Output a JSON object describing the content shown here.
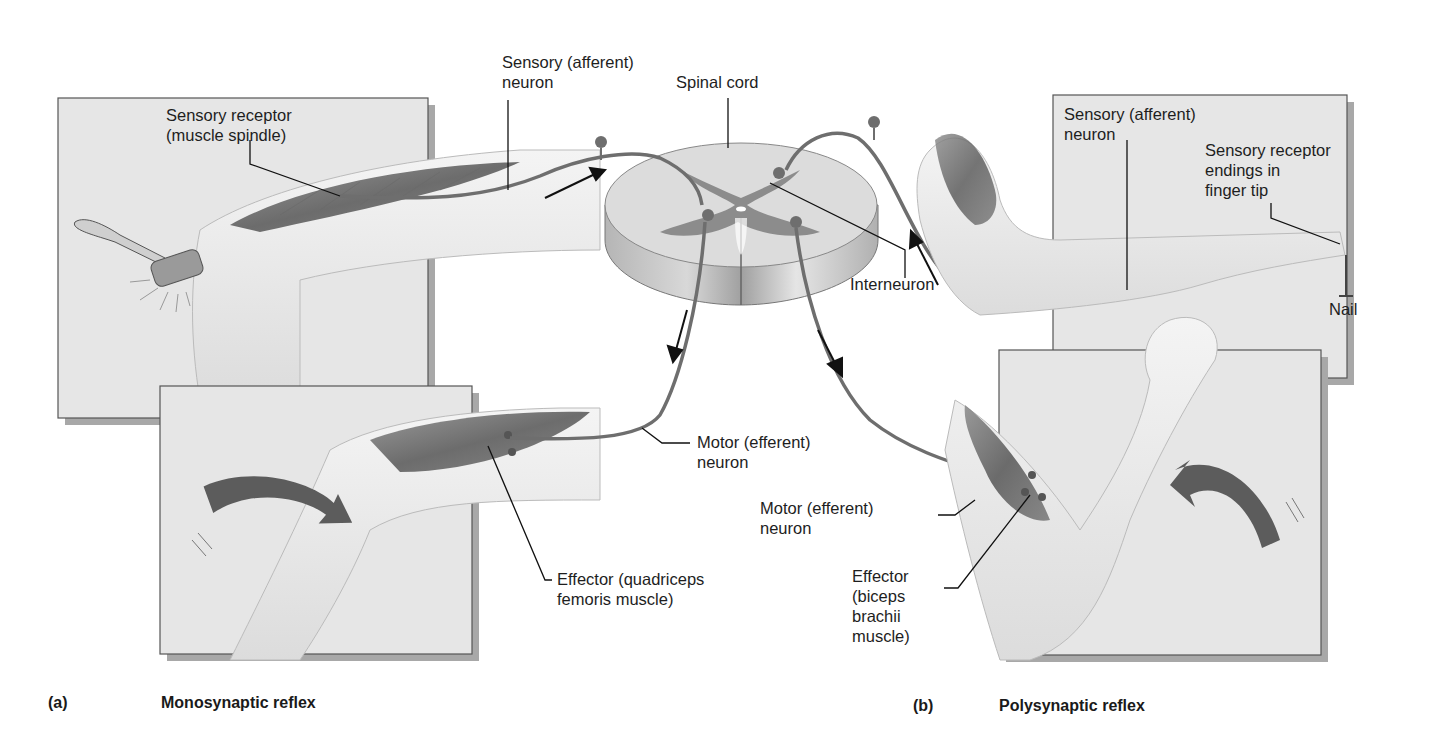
{
  "figure": {
    "panel_a": {
      "letter": "(a)",
      "title": "Monosynaptic reflex",
      "labels": {
        "sensory_neuron": "Sensory (afferent)\nneuron",
        "sensory_receptor": "Sensory receptor\n(muscle spindle)",
        "motor_neuron": "Motor (efferent)\nneuron",
        "effector": "Effector (quadriceps\nfemoris muscle)"
      }
    },
    "center": {
      "spinal_cord": "Spinal cord",
      "interneuron": "Interneuron"
    },
    "panel_b": {
      "letter": "(b)",
      "title": "Polysynaptic reflex",
      "labels": {
        "sensory_neuron": "Sensory (afferent)\nneuron",
        "sensory_receptor": "Sensory receptor\nendings in\nfinger tip",
        "nail": "Nail",
        "motor_neuron": "Motor (efferent)\nneuron",
        "effector": "Effector\n(biceps\nbrachii\nmuscle)"
      }
    },
    "colors": {
      "panel_bg": "#e6e6e6",
      "panel_border": "#555555",
      "panel_shadow": "#a8a8a8",
      "neuron": "#6e6e6e",
      "muscle": "#5a5a5a",
      "skin": "#eeeeee",
      "cord_white_matter": "#d9d9d9",
      "cord_gray_matter": "#8c8c8c",
      "arrow_big": "#5c5c5c"
    }
  }
}
